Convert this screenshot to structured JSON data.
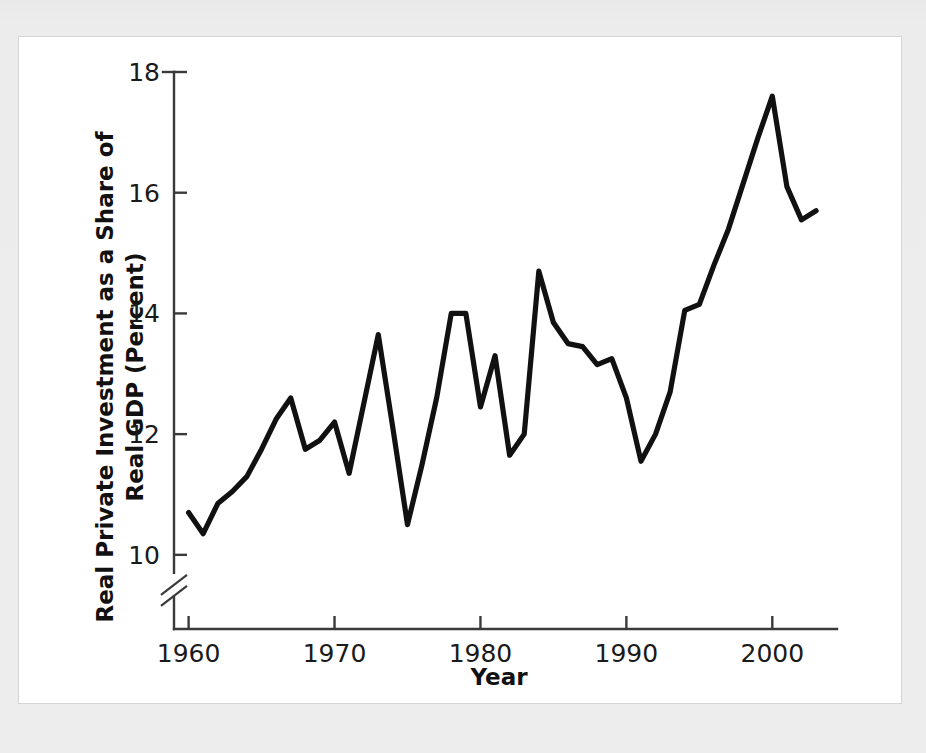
{
  "figure": {
    "background_color": "#ffffff",
    "page_color": "#ebebeb",
    "line_color": "#111111",
    "axis_color": "#3a3a3a"
  },
  "chart_data": {
    "type": "line",
    "title": "",
    "xlabel": "Year",
    "ylabel": "Real Private Investment as a Share of Real GDP (Percent)",
    "ylabel_line1": "Real Private Investment as a Share of",
    "ylabel_line2": "Real GDP (Percent)",
    "xlim": [
      1959.0,
      2003.2
    ],
    "ylim": [
      9.55,
      18.0
    ],
    "yticks": [
      10,
      12,
      14,
      16,
      18
    ],
    "ytick_labels": [
      "10",
      "12",
      "14",
      "16",
      "18"
    ],
    "xticks": [
      1960,
      1970,
      1980,
      1990,
      2000
    ],
    "xtick_labels": [
      "1960",
      "1970",
      "1980",
      "1990",
      "2000"
    ],
    "grid": false,
    "legend": false,
    "axis_break": true,
    "axis_break_note": "y-axis broken below 10",
    "x": [
      1960,
      1961,
      1962,
      1963,
      1964,
      1965,
      1966,
      1967,
      1968,
      1969,
      1970,
      1971,
      1972,
      1973,
      1974,
      1975,
      1976,
      1977,
      1978,
      1979,
      1980,
      1981,
      1982,
      1983,
      1984,
      1985,
      1986,
      1987,
      1988,
      1989,
      1990,
      1991,
      1992,
      1993,
      1994,
      1995,
      1996,
      1997,
      1998,
      1999,
      2000,
      2001,
      2002,
      2003
    ],
    "y": [
      10.7,
      10.35,
      10.85,
      11.05,
      11.3,
      11.75,
      12.25,
      12.6,
      11.75,
      11.9,
      12.2,
      11.35,
      12.5,
      13.65,
      12.1,
      10.5,
      11.5,
      12.6,
      14.0,
      14.0,
      12.45,
      13.3,
      11.65,
      12.0,
      14.7,
      13.85,
      13.5,
      13.45,
      13.15,
      13.25,
      12.6,
      11.55,
      12.0,
      12.7,
      14.05,
      14.15,
      14.8,
      15.4,
      16.15,
      16.9,
      17.6,
      16.1,
      15.55,
      15.7
    ],
    "series_name": "Real private investment share of real GDP"
  }
}
